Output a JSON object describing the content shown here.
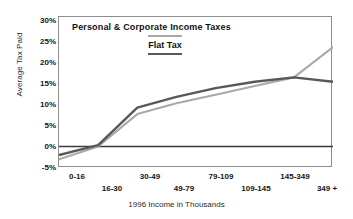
{
  "chart_data": {
    "type": "line",
    "title": "",
    "xlabel": "1996 Income in Thousands",
    "ylabel": "Average Tax Paid",
    "categories": [
      "0-16",
      "16-30",
      "30-49",
      "49-79",
      "79-109",
      "109-145",
      "145-349",
      "349 +"
    ],
    "ytick_labels": [
      "30%",
      "25%",
      "20%",
      "15%",
      "10%",
      "5%",
      "0%",
      "-5%"
    ],
    "ytick_values": [
      30,
      25,
      20,
      15,
      10,
      5,
      0,
      -5
    ],
    "ylim": [
      -5,
      30
    ],
    "grid": false,
    "legend_position": "inside-top-left",
    "zero_line": true,
    "series": [
      {
        "name": "Personal & Corporate Income Taxes",
        "color": "#a9a9a9",
        "values": [
          -3.0,
          0.0,
          7.5,
          10.0,
          12.0,
          14.0,
          16.0,
          23.0
        ]
      },
      {
        "name": "Flat Tax",
        "color": "#585858",
        "values": [
          -2.0,
          0.3,
          9.0,
          11.5,
          13.5,
          15.0,
          16.0,
          15.0
        ]
      }
    ]
  },
  "legend": {
    "series_one_label": "Personal & Corporate Income Taxes",
    "series_two_label": "Flat Tax",
    "series_one_color": "#a9a9a9",
    "series_two_color": "#585858"
  },
  "axes": {
    "y_title": "Average Tax Paid",
    "x_title": "1996 Income in Thousands",
    "y_labels": {
      "t0": "30%",
      "t1": "25%",
      "t2": "20%",
      "t3": "15%",
      "t4": "10%",
      "t5": "5%",
      "t6": "0%",
      "t7": "-5%"
    },
    "x_labels": {
      "c0": "0-16",
      "c1": "16-30",
      "c2": "30-49",
      "c3": "49-79",
      "c4": "79-109",
      "c5": "109-145",
      "c6": "145-349",
      "c7": "349 +"
    }
  }
}
